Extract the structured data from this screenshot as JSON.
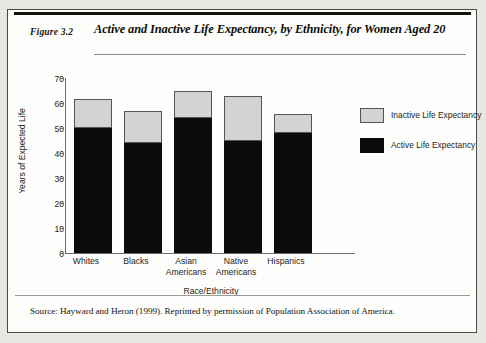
{
  "figure": {
    "number_label": "Figure 3.2",
    "title": "Active and Inactive Life Expectancy, by Ethnicity, for Women Aged 20",
    "source": "Source: Hayward and Heron (1999). Reprinted by permission of Population Association of America."
  },
  "legend": {
    "items": [
      {
        "label": "Inactive Life Expectancy",
        "color": "#d3d3d3"
      },
      {
        "label": "Active Life Expectancy",
        "color": "#0b0b0b"
      }
    ]
  },
  "axis": {
    "y_ticks": [
      "70",
      "60",
      "50",
      "40",
      "30",
      "20",
      "10",
      "0"
    ],
    "x_labels": [
      {
        "line1": "Whites",
        "line2": ""
      },
      {
        "line1": "Blacks",
        "line2": ""
      },
      {
        "line1": "Asian",
        "line2": "Americans"
      },
      {
        "line1": "Native",
        "line2": "Americans"
      },
      {
        "line1": "Hispanics",
        "line2": ""
      }
    ]
  },
  "chart_data": {
    "type": "bar",
    "title": "Active and Inactive Life Expectancy, by Ethnicity, for Women Aged 20",
    "xlabel": "Race/Ethnicity",
    "ylabel": "Years of Expected Life",
    "ylim": [
      0,
      70
    ],
    "ytick_step": 10,
    "grid": false,
    "stacked": true,
    "legend_position": "right",
    "categories": [
      "Whites",
      "Blacks",
      "Asian Americans",
      "Native Americans",
      "Hispanics"
    ],
    "series": [
      {
        "name": "Active Life Expectancy",
        "color": "#0b0b0b",
        "values": [
          50,
          44,
          54,
          45,
          48
        ]
      },
      {
        "name": "Inactive Life Expectancy",
        "color": "#d3d3d3",
        "values": [
          11.5,
          13,
          11,
          18,
          7.5
        ]
      }
    ],
    "totals": [
      61.5,
      57,
      65,
      63,
      55.5
    ]
  }
}
